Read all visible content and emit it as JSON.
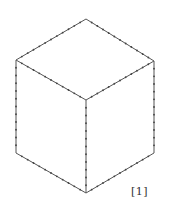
{
  "figure": {
    "label": "[1]",
    "shape": "isometric-cube",
    "stroke_color": "#555555",
    "tick_color": "#444444",
    "vertices": {
      "top": [
        86,
        19
      ],
      "left_top": [
        16,
        60
      ],
      "right_top": [
        154,
        61
      ],
      "center": [
        86,
        100
      ],
      "left_bottom": [
        16,
        153
      ],
      "right_bottom": [
        154,
        153
      ],
      "bottom": [
        86,
        193
      ]
    },
    "edges": [
      [
        "top",
        "left_top"
      ],
      [
        "top",
        "right_top"
      ],
      [
        "left_top",
        "center"
      ],
      [
        "right_top",
        "center"
      ],
      [
        "left_top",
        "left_bottom"
      ],
      [
        "right_top",
        "right_bottom"
      ],
      [
        "center",
        "bottom"
      ],
      [
        "left_bottom",
        "bottom"
      ],
      [
        "right_bottom",
        "bottom"
      ]
    ],
    "ticks_per_edge": 12
  }
}
